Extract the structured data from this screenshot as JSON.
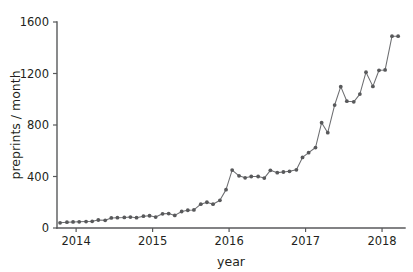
{
  "chart_data": {
    "type": "line",
    "title": "",
    "subtitle": "",
    "xlabel": "year",
    "ylabel": "preprints / month",
    "xlim": [
      2013.75,
      2018.3
    ],
    "ylim": [
      0,
      1600
    ],
    "grid": false,
    "legend": null,
    "marker": "circle",
    "line_color": "#6d6e71",
    "marker_color": "#58595b",
    "axis_color": "#58595b",
    "xticks": [
      2014,
      2015,
      2016,
      2017,
      2018
    ],
    "xtick_labels": [
      "2014",
      "2015",
      "2016",
      "2017",
      "2018"
    ],
    "yticks": [
      0,
      400,
      800,
      1200,
      1600
    ],
    "ytick_labels": [
      "0",
      "400",
      "800",
      "1200",
      "1600"
    ],
    "series": [
      {
        "name": "preprints per month",
        "x": [
          2013.79,
          2013.88,
          2013.96,
          2014.04,
          2014.13,
          2014.21,
          2014.29,
          2014.38,
          2014.46,
          2014.54,
          2014.63,
          2014.71,
          2014.79,
          2014.88,
          2014.96,
          2015.04,
          2015.13,
          2015.21,
          2015.29,
          2015.38,
          2015.46,
          2015.54,
          2015.63,
          2015.71,
          2015.79,
          2015.88,
          2015.96,
          2016.04,
          2016.13,
          2016.21,
          2016.29,
          2016.38,
          2016.46,
          2016.54,
          2016.63,
          2016.71,
          2016.79,
          2016.88,
          2016.96,
          2017.04,
          2017.13,
          2017.21,
          2017.29,
          2017.38,
          2017.46,
          2017.54,
          2017.63,
          2017.71,
          2017.79,
          2017.88,
          2017.96,
          2018.04,
          2018.13,
          2018.21
        ],
        "values": [
          40,
          45,
          47,
          48,
          50,
          52,
          62,
          60,
          78,
          80,
          82,
          85,
          80,
          92,
          95,
          85,
          110,
          112,
          98,
          128,
          138,
          140,
          185,
          200,
          185,
          215,
          298,
          450,
          405,
          390,
          400,
          400,
          388,
          448,
          430,
          435,
          440,
          452,
          548,
          585,
          625,
          818,
          740,
          955,
          1098,
          985,
          980,
          1040,
          1210,
          1100,
          1225,
          1228,
          1490,
          1490
        ]
      }
    ]
  },
  "axis": {
    "y_title": "preprints / month",
    "x_title": "year"
  }
}
